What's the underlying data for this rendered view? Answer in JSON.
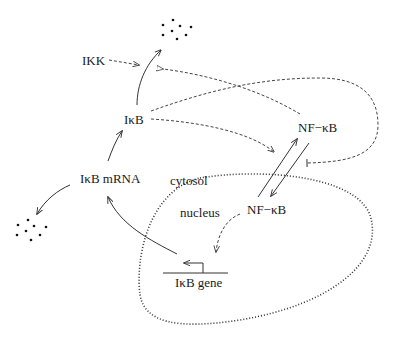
{
  "diagram": {
    "labels": {
      "ikk": "IKK",
      "ikb": "IκB",
      "ikb_mrna": "IκB mRNA",
      "nfkb_cytosol": "NF−κB",
      "nfkb_nucleus": "NF−κB",
      "cytosol": "cytosol",
      "nucleus": "nucleus",
      "ikb_gene": "IκB gene"
    },
    "compartments": [
      {
        "name": "cytosol",
        "label": "cytosol"
      },
      {
        "name": "nucleus",
        "label": "nucleus",
        "border": "dotted"
      }
    ],
    "edges": [
      {
        "from": "IκB",
        "to": "degradation (top)",
        "style": "solid",
        "type": "arrow"
      },
      {
        "from": "IKK",
        "to": "IκB degradation",
        "style": "dashed",
        "type": "arrow"
      },
      {
        "from": "NF−κB (cytosol)",
        "to": "IκB degradation",
        "style": "dashed",
        "type": "arrow"
      },
      {
        "from": "IκB",
        "to": "NF−κB translocation",
        "style": "dashed",
        "type": "inhibition",
        "note": "loop inhibits import"
      },
      {
        "from": "IκB",
        "to": "NF−κB export",
        "style": "dashed",
        "type": "arrow"
      },
      {
        "from": "NF−κB (cytosol)",
        "to": "NF−κB (nucleus)",
        "style": "solid",
        "type": "arrow"
      },
      {
        "from": "NF−κB (nucleus)",
        "to": "NF−κB (cytosol)",
        "style": "solid",
        "type": "arrow"
      },
      {
        "from": "NF−κB (nucleus)",
        "to": "IκB gene",
        "style": "dashed",
        "type": "arrow"
      },
      {
        "from": "IκB gene",
        "to": "IκB mRNA",
        "style": "solid",
        "type": "arrow"
      },
      {
        "from": "IκB mRNA",
        "to": "IκB",
        "style": "solid",
        "type": "arrow"
      },
      {
        "from": "IκB mRNA",
        "to": "degradation (left)",
        "style": "solid",
        "type": "arrow"
      }
    ],
    "degradation_symbols": [
      {
        "position": "top",
        "glyph": "scattered dots"
      },
      {
        "position": "left",
        "glyph": "scattered dots"
      }
    ],
    "colors": {
      "background": "#ffffff",
      "ink": "#1a1a1a"
    }
  }
}
